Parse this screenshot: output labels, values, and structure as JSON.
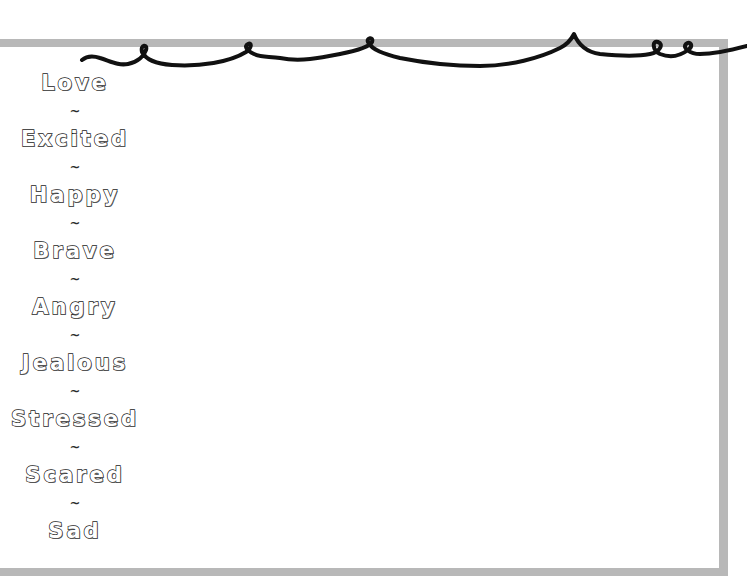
{
  "page": {
    "frame_color": "#b8b8b8",
    "string_color": "#111111",
    "text_outline_color": "#1a1a1a",
    "background_color": "#ffffff"
  },
  "separator": "~",
  "words": [
    {
      "label": "Love"
    },
    {
      "label": "Excited"
    },
    {
      "label": "Happy"
    },
    {
      "label": "Brave"
    },
    {
      "label": "Angry"
    },
    {
      "label": "Jealous"
    },
    {
      "label": "Stressed"
    },
    {
      "label": "Scared"
    },
    {
      "label": "Sad"
    }
  ]
}
